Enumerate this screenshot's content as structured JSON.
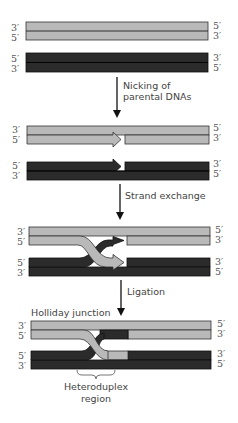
{
  "colors": {
    "parent_a": "#b9b9b9",
    "parent_b": "#2b2b2b",
    "outline": "#1a1a1a",
    "text": "#555555"
  },
  "steps": [
    {
      "name": "initial",
      "labels": {
        "left": [
          "3′",
          "5′",
          "5′",
          "3′"
        ],
        "right": [
          "5′",
          "3′",
          "3′",
          "5′"
        ]
      }
    },
    {
      "name": "nicked",
      "labels": {
        "left": [
          "3′",
          "5′",
          "5′",
          "3′"
        ],
        "right": [
          "5′",
          "3′",
          "3′",
          "5′"
        ]
      }
    },
    {
      "name": "exchanged",
      "labels": {
        "left": [
          "3′",
          "5′",
          "5′",
          "3′"
        ],
        "right": [
          "5′",
          "3′",
          "3′",
          "5′"
        ]
      }
    },
    {
      "name": "ligated",
      "labels": {
        "left": [
          "3′",
          "5′",
          "5′",
          "3′"
        ],
        "right": [
          "5′",
          "3′",
          "3′",
          "5′"
        ]
      }
    }
  ],
  "arrows": [
    {
      "label_line1": "Nicking of",
      "label_line2": "parental DNAs"
    },
    {
      "label_line1": "Strand exchange",
      "label_line2": ""
    },
    {
      "label_line1": "Ligation",
      "label_line2": ""
    }
  ],
  "annotations": {
    "holliday": "Holliday junction",
    "heteroduplex_line1": "Heteroduplex",
    "heteroduplex_line2": "region"
  }
}
